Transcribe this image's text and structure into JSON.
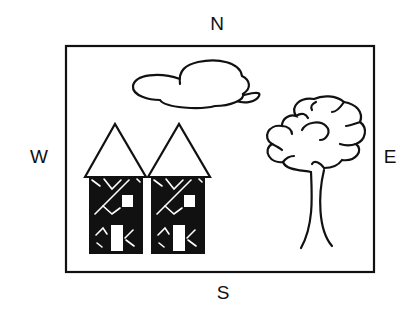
{
  "compass": {
    "north": "N",
    "south": "S",
    "west": "W",
    "east": "E"
  },
  "scene": {
    "frame": "map-border",
    "elements": [
      "cloud",
      "house-left",
      "house-right",
      "tree"
    ]
  },
  "colors": {
    "stroke": "#111111",
    "fill_dark": "#111111",
    "background": "#ffffff"
  }
}
